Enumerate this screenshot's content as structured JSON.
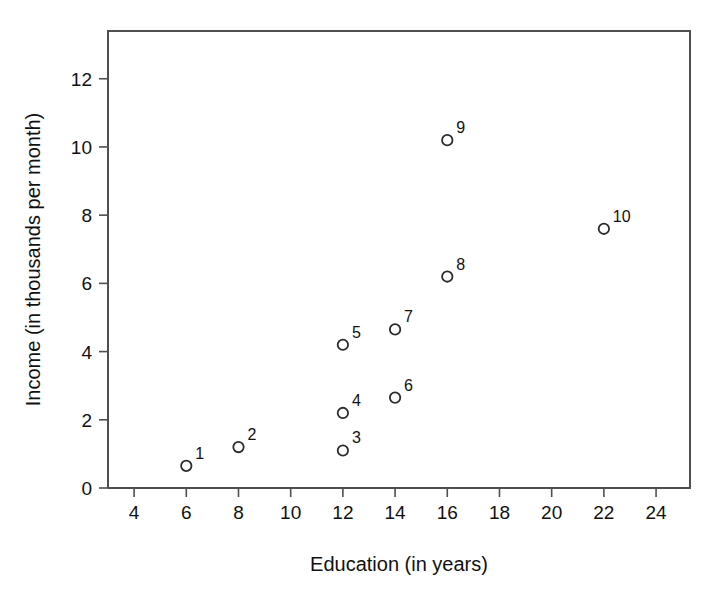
{
  "chart_data": {
    "type": "scatter",
    "title": "",
    "xlabel": "Education (in years)",
    "ylabel": "Income (in thousands per month)",
    "xlim": [
      3,
      25.3
    ],
    "ylim": [
      0,
      13.4
    ],
    "grid": false,
    "legend": "none",
    "xticks": [
      4,
      6,
      8,
      10,
      12,
      14,
      16,
      18,
      20,
      22,
      24
    ],
    "xtick_labels": [
      "4",
      "6",
      "8",
      "10",
      "12",
      "14",
      "16",
      "18",
      "20",
      "22",
      "24"
    ],
    "yticks": [
      0,
      2,
      4,
      6,
      8,
      10,
      12
    ],
    "ytick_labels": [
      "0",
      "2",
      "4",
      "6",
      "8",
      "10",
      "12"
    ],
    "marker": "open-circle",
    "marker_color": "#2b2b2b",
    "points": [
      {
        "label": "1",
        "x": 6,
        "y": 0.65
      },
      {
        "label": "2",
        "x": 8,
        "y": 1.2
      },
      {
        "label": "3",
        "x": 12,
        "y": 1.1
      },
      {
        "label": "4",
        "x": 12,
        "y": 2.2
      },
      {
        "label": "5",
        "x": 12,
        "y": 4.2
      },
      {
        "label": "6",
        "x": 14,
        "y": 2.65
      },
      {
        "label": "7",
        "x": 14,
        "y": 4.65
      },
      {
        "label": "8",
        "x": 16,
        "y": 6.2
      },
      {
        "label": "9",
        "x": 16,
        "y": 10.2
      },
      {
        "label": "10",
        "x": 22,
        "y": 7.6
      }
    ]
  }
}
